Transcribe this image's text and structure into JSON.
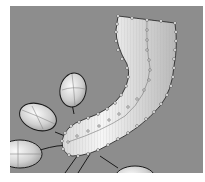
{
  "viewport": {
    "background": "#8d8d8d",
    "view": "perspective",
    "objects": [
      {
        "type": "nurbs-surface",
        "name": "curved-tube",
        "selected": true,
        "control_points_visible": true
      },
      {
        "type": "ellipsoid",
        "name": "ellipsoid-top"
      },
      {
        "type": "ellipsoid",
        "name": "ellipsoid-middle-left"
      },
      {
        "type": "ellipsoid",
        "name": "ellipsoid-left"
      },
      {
        "type": "ellipsoid",
        "name": "ellipsoid-bottom"
      }
    ],
    "colors": {
      "surface_highlight": "#f4f4f4",
      "surface_shade": "#c8c8c8",
      "control_point": "#ffffff",
      "curve": "#1a1a1a"
    }
  }
}
